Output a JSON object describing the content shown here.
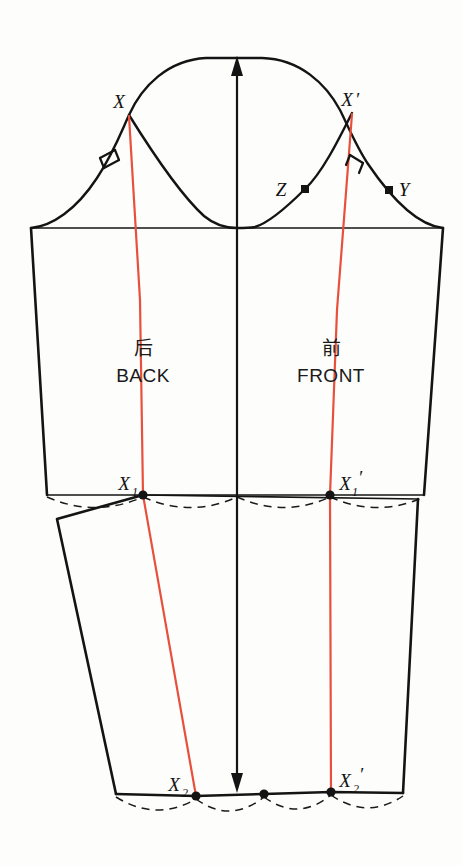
{
  "diagram": {
    "colors": {
      "outline": "#141414",
      "seam_red": "#e8503c",
      "dashed": "#1a1a1a",
      "paper": "#fdfdfc"
    },
    "panels": [
      {
        "id": "back",
        "cjk_label": "后",
        "latin_label": "BACK"
      },
      {
        "id": "front",
        "cjk_label": "前",
        "latin_label": "FRONT"
      }
    ],
    "points": [
      {
        "name": "X",
        "label": "X",
        "sub": "",
        "prime": false,
        "x": 129,
        "y": 115,
        "marker": "none"
      },
      {
        "name": "Xp",
        "label": "X",
        "sub": "",
        "prime": true,
        "x": 352,
        "y": 113,
        "marker": "none"
      },
      {
        "name": "Y",
        "label": "Y",
        "sub": "",
        "prime": false,
        "x": 389,
        "y": 190,
        "marker": "square"
      },
      {
        "name": "Z",
        "label": "Z",
        "sub": "",
        "prime": false,
        "x": 305,
        "y": 189,
        "marker": "square"
      },
      {
        "name": "X1",
        "label": "X",
        "sub": "1",
        "prime": false,
        "x": 143,
        "y": 495,
        "marker": "dot"
      },
      {
        "name": "X1p",
        "label": "X",
        "sub": "1",
        "prime": true,
        "x": 330,
        "y": 495,
        "marker": "dot"
      },
      {
        "name": "X2",
        "label": "X",
        "sub": "2",
        "prime": false,
        "x": 196,
        "y": 796,
        "marker": "dot"
      },
      {
        "name": "X2p",
        "label": "X",
        "sub": "2",
        "prime": true,
        "x": 331,
        "y": 792,
        "marker": "dot"
      },
      {
        "name": "Hc",
        "label": "",
        "sub": "",
        "prime": false,
        "x": 264,
        "y": 794,
        "marker": "dot"
      }
    ],
    "notches": [
      {
        "id": "back-notch",
        "count": 2,
        "side": "back"
      },
      {
        "id": "front-notch",
        "count": 1,
        "side": "front"
      }
    ],
    "grainline": {
      "top_arrow": "up",
      "bottom_arrow": "down",
      "x": 237,
      "y_top": 58,
      "y_bottom": 791
    },
    "lines": {
      "biceps_y": 228,
      "elbow_y": 495,
      "hem_y": 793
    }
  }
}
